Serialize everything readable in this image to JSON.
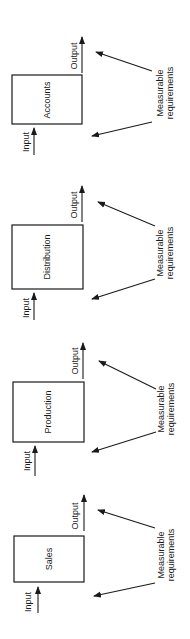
{
  "diagram": {
    "orientation": "rotated -90deg (text reads bottom-to-top)",
    "stages": [
      {
        "name": "Sales",
        "input_label": "Input",
        "output_label": "Output",
        "req_line1": "Measurable",
        "req_line2": "requirements"
      },
      {
        "name": "Production",
        "input_label": "Input",
        "output_label": "Output",
        "req_line1": "Measurable",
        "req_line2": "requirements"
      },
      {
        "name": "Distribution",
        "input_label": "Input",
        "output_label": "Output",
        "req_line1": "Measurable",
        "req_line2": "requirements"
      },
      {
        "name": "Accounts",
        "input_label": "Input",
        "output_label": "Output",
        "req_line1": "Measurable",
        "req_line2": "requirements"
      }
    ],
    "colors": {
      "ink": "#1a1a1a",
      "background": "#ffffff"
    }
  }
}
